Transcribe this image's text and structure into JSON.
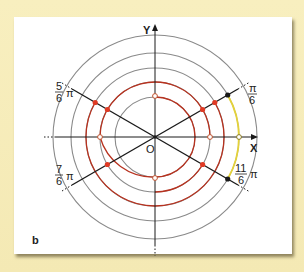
{
  "figure": {
    "panel_label": "b",
    "axes": {
      "x_label": "X",
      "y_label": "Y",
      "origin_label": "O"
    },
    "angle_labels": [
      {
        "id": "pi_over_6",
        "numerator": "π",
        "denominator": "6",
        "suffix": ""
      },
      {
        "id": "five_sixth_pi",
        "numerator": "5",
        "denominator": "6",
        "suffix": "π"
      },
      {
        "id": "seven_sixth_pi",
        "numerator": "7",
        "denominator": "6",
        "suffix": "π"
      },
      {
        "id": "eleven_sixth_pi",
        "numerator": "11",
        "denominator": "6",
        "suffix": "π"
      }
    ],
    "colors": {
      "background": "#f6ecb8",
      "panel": "#ffffff",
      "circle_gray": "#8a8a8a",
      "arc_red": "#b8321f",
      "dot_red": "#e03a24",
      "arc_yellow": "#e4d23a",
      "line_black": "#1a1a1a"
    }
  }
}
